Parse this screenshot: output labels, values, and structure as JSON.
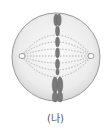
{
  "diagram": {
    "label": "(나)",
    "elements": [
      "cell-membrane",
      "spindle-fibers",
      "centriole-left",
      "centriole-right",
      "chromosomes-aligned-at-equator"
    ],
    "colors": {
      "cell_fill": "#e6e6e6",
      "cell_edge": "#9a9a9a",
      "chromosome": "#6a6a6a",
      "spindle": "#888888"
    }
  }
}
